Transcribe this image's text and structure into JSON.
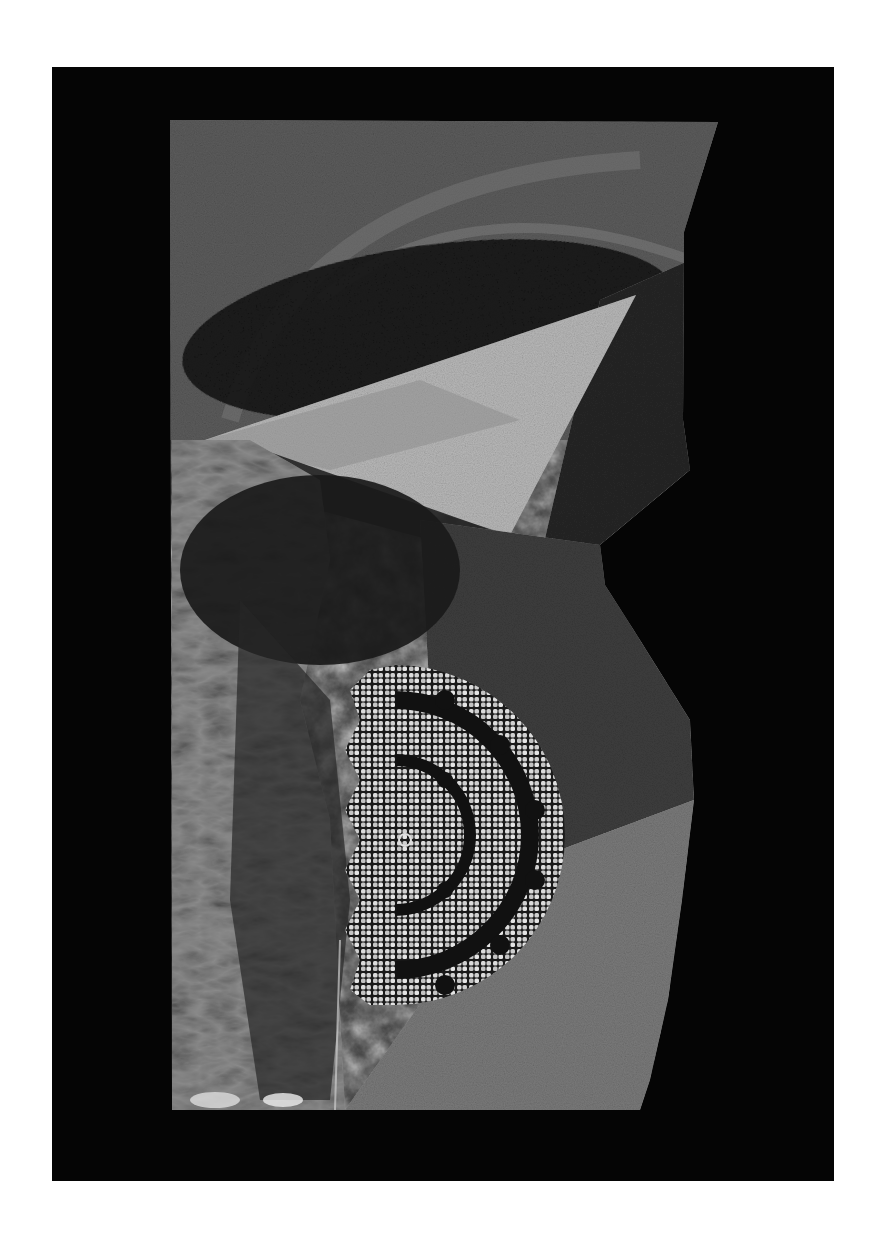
{
  "page": {
    "width": 878,
    "height": 1251,
    "background": "#ffffff"
  },
  "mount": {
    "x": 52,
    "y": 67,
    "width": 782,
    "height": 1114,
    "color": "#050505"
  },
  "artwork": {
    "description": "Monochrome collage print: crumpled paper, translucent triangle, dark elliptical band, crocheted lace doily",
    "outline": "170,120 718,122 700,180 684,232 683,420 690,470 600,545 605,585 640,640 690,720 694,800 682,900 668,1000 650,1080 640,1110 172,1110",
    "base_tone": "#3a3a3a",
    "elements": [
      {
        "name": "top-textured-field",
        "tone": "#5c5c5c"
      },
      {
        "name": "dark-elliptical-band",
        "tone": "#151515",
        "cx": 430,
        "cy": 320,
        "rx": 250,
        "ry": 85,
        "rotate": -8
      },
      {
        "name": "pale-triangle",
        "tone": "#b8b8b8",
        "points": "205,440 636,295 510,535"
      },
      {
        "name": "dark-wedge-strip",
        "tone": "#262626",
        "points": "205,440 260,445 520,545 500,560 300,500"
      },
      {
        "name": "crumpled-paper-left",
        "tone": "#8a8a8a",
        "points": "172,440 250,440 320,480 330,560 300,700 330,820 340,1110 172,1110"
      },
      {
        "name": "dark-shadow-mass",
        "tone": "#1a1a1a",
        "cx": 320,
        "cy": 560,
        "rx": 130,
        "ry": 90
      },
      {
        "name": "lace-doily",
        "tone": "#d8d8d8",
        "cx": 395,
        "cy": 835,
        "r": 170
      },
      {
        "name": "lower-right-paper",
        "tone": "#7a7a7a"
      }
    ]
  }
}
